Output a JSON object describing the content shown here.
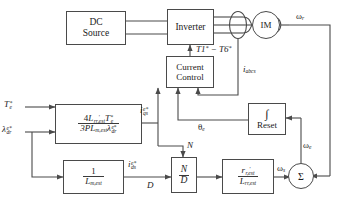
{
  "diagram": {
    "stroke_color": "#4a4a4a",
    "text_color": "#1a1a1a",
    "background": "#ffffff"
  },
  "blocks": {
    "dc_source": {
      "line1": "DC",
      "line2": "Source"
    },
    "inverter": {
      "label": "Inverter"
    },
    "current_control": {
      "line1": "Current",
      "line2": "Control"
    },
    "im": {
      "label": "IM"
    },
    "torque_eq": {
      "numerator": "4L'rr,est T*e",
      "denominator": "3P Lm,est λe*dr",
      "num_parts": {
        "coef": "4",
        "l": "L",
        "l_sub": "rr,est",
        "t": "T",
        "t_sub": "e"
      },
      "den_parts": {
        "coef": "3P",
        "l": "L",
        "l_sub": "m,est",
        "lam": "λ",
        "lam_sub": "dr"
      }
    },
    "flux_eq": {
      "numerator": "1",
      "denominator": "Lm,est",
      "den_parts": {
        "l": "L",
        "l_sub": "m,est"
      }
    },
    "divider": {
      "numerator": "N",
      "denominator": "D"
    },
    "slip_gain": {
      "numerator": "r'r,est",
      "denominator": "Lrr,est",
      "num_parts": {
        "r": "r",
        "r_sub": "r,est"
      },
      "den_parts": {
        "l": "L",
        "l_sub": "rr,est"
      }
    },
    "integrator": {
      "symbol": "∫",
      "label": "Reset"
    },
    "summer": {
      "symbol": "Σ"
    }
  },
  "signals": {
    "torque_ref": {
      "base": "T",
      "sub": "e",
      "sup": "*"
    },
    "flux_ref": {
      "base": "λ",
      "sub": "dr",
      "sup": "e*"
    },
    "iqs_ref": {
      "base": "i",
      "sub": "qs",
      "sup": "e*"
    },
    "ids_ref": {
      "base": "i",
      "sub": "ds",
      "sup": "e*"
    },
    "gate_signals": {
      "text": "T1* − T6*",
      "t1": "T1",
      "t6": "T6",
      "dash": "−"
    },
    "i_abcs": {
      "base": "i",
      "sub": "abcs"
    },
    "theta_e": {
      "base": "θ",
      "sub": "e"
    },
    "omega_r": {
      "base": "ω",
      "sub": "r"
    },
    "omega_e": {
      "base": "ω",
      "sub": "e"
    },
    "omega_s": {
      "base": "ω",
      "sub": "s"
    },
    "divider_n": {
      "text": "N"
    },
    "divider_d": {
      "text": "D"
    }
  }
}
